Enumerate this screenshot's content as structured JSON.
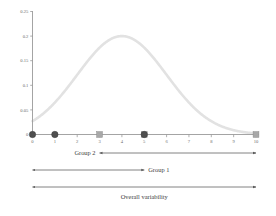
{
  "chart_data": {
    "type": "line",
    "title": "",
    "xlabel": "",
    "ylabel": "",
    "xlim": [
      0,
      10
    ],
    "ylim": [
      0,
      0.25
    ],
    "grid": false,
    "legend": "none",
    "curve": {
      "name": "normal density",
      "mean": 4,
      "sigma": 2,
      "peak_x": 4,
      "peak_y": 0.2,
      "color": "#e2e2e2",
      "x": [
        0,
        0.5,
        1,
        1.5,
        2,
        2.5,
        3,
        3.5,
        4,
        4.5,
        5,
        5.5,
        6,
        6.5,
        7,
        7.5,
        8,
        8.5,
        9,
        9.5,
        10
      ],
      "y": [
        0.027,
        0.043,
        0.065,
        0.091,
        0.121,
        0.15,
        0.176,
        0.194,
        0.2,
        0.194,
        0.176,
        0.15,
        0.121,
        0.091,
        0.065,
        0.043,
        0.027,
        0.016,
        0.009,
        0.004,
        0.002
      ]
    },
    "xticks": [
      "0",
      "1",
      "2",
      "3",
      "4",
      "5",
      "6",
      "7",
      "8",
      "9",
      "10"
    ],
    "xtick_values": [
      0,
      1,
      2,
      3,
      4,
      5,
      6,
      7,
      8,
      9,
      10
    ],
    "yticks": [
      "0",
      "0.05",
      "0.1",
      "0.15",
      "0.2",
      "0.25"
    ],
    "ytick_values": [
      0,
      0.05,
      0.1,
      0.15,
      0.2,
      0.25
    ],
    "markers": [
      {
        "name": "circle-x0",
        "shape": "circle",
        "x": 0,
        "y": 0,
        "color": "#4f4f4f"
      },
      {
        "name": "circle-x1",
        "shape": "circle",
        "x": 1,
        "y": 0,
        "color": "#4f4f4f"
      },
      {
        "name": "square-x3",
        "shape": "square",
        "x": 3,
        "y": 0,
        "color": "#a8a8a8"
      },
      {
        "name": "square-x5",
        "shape": "square",
        "x": 5,
        "y": 0,
        "color": "#a8a8a8"
      },
      {
        "name": "circle-x5",
        "shape": "circle",
        "x": 5,
        "y": 0,
        "color": "#4f4f4f"
      },
      {
        "name": "square-x10",
        "shape": "square",
        "x": 10,
        "y": 0,
        "color": "#a8a8a8"
      }
    ],
    "annotations": [
      {
        "name": "group-2",
        "label": "Group 2",
        "from_x": 3,
        "to_x": 10,
        "label_side": "left",
        "arrow": "double"
      },
      {
        "name": "group-1",
        "label": "Group 1",
        "from_x": 0,
        "to_x": 5,
        "label_side": "right",
        "arrow": "double"
      },
      {
        "name": "overall-variability",
        "label": "Overall variability",
        "from_x": 0,
        "to_x": 10,
        "label_side": "below",
        "arrow": "double"
      }
    ]
  },
  "colors": {
    "curve": "#e2e2e2",
    "axis": "#9a9a9a",
    "arrow": "#5a5a5a",
    "marker_dark": "#4f4f4f",
    "marker_light": "#a8a8a8",
    "tick_text": "#6b6b6b",
    "label_text": "#3d3d3d",
    "background": "#ffffff"
  }
}
